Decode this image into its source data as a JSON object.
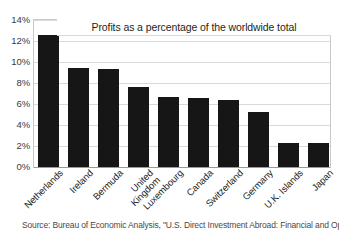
{
  "chart_data": {
    "type": "bar",
    "title": "Profits as a percentage of the worldwide total",
    "xlabel": "",
    "ylabel": "",
    "ylim": [
      0,
      14
    ],
    "ytick_labels": [
      "14%",
      "12%",
      "10%",
      "8%",
      "6%",
      "4%",
      "2%",
      "0%"
    ],
    "ytick_values": [
      14,
      12,
      10,
      8,
      6,
      4,
      2,
      0
    ],
    "grid": true,
    "legend": "none",
    "bar_color": "#161616",
    "categories": [
      "Netherlands",
      "Ireland",
      "Bermuda",
      "United Kingdom",
      "Luxembourg",
      "Canada",
      "Switzerland",
      "Germany",
      "U.K. Islands",
      "Japan"
    ],
    "values": [
      12.6,
      9.4,
      9.3,
      7.6,
      6.7,
      6.6,
      6.4,
      5.2,
      2.3,
      2.3
    ],
    "value_unit": "%"
  },
  "source": {
    "note": "Source: Bureau of Economic Analysis, \"U.S. Direct Investment Abroad: Financial and Oper"
  }
}
